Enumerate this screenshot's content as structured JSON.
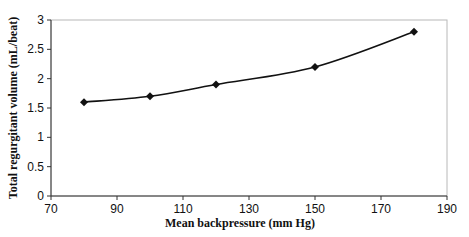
{
  "chart_data": {
    "type": "line",
    "title": "",
    "xlabel": "Mean backpressure (mm Hg)",
    "ylabel": "Total regurgitant volume (mL/beat)",
    "x": [
      80,
      100,
      120,
      150,
      180
    ],
    "series": [
      {
        "name": "Total regurgitant volume",
        "values": [
          1.6,
          1.7,
          1.9,
          2.2,
          2.8
        ],
        "marker": "diamond",
        "color": "#111111"
      }
    ],
    "xlim": [
      70,
      190
    ],
    "ylim": [
      0,
      3
    ],
    "xticks": [
      "70",
      "90",
      "110",
      "130",
      "150",
      "170",
      "190"
    ],
    "yticks": [
      "0",
      "0.5",
      "1",
      "1.5",
      "2",
      "2.5",
      "3"
    ],
    "grid": false,
    "legend": "none"
  }
}
